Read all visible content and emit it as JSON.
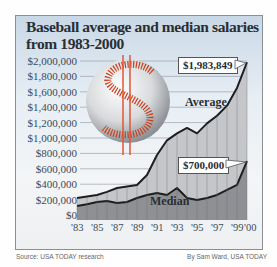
{
  "chart_data": {
    "type": "area",
    "title": "Baseball average and median salaries from 1983-2000",
    "xlabel": "",
    "ylabel": "",
    "ylim": [
      0,
      2000000
    ],
    "grid": true,
    "x": [
      1983,
      1984,
      1985,
      1986,
      1987,
      1988,
      1989,
      1990,
      1991,
      1992,
      1993,
      1994,
      1995,
      1996,
      1997,
      1998,
      1999,
      2000
    ],
    "x_tick_labels": [
      "'83",
      "'85",
      "'87",
      "'89",
      "'91",
      "'93",
      "'95",
      "'97",
      "'99",
      "'00"
    ],
    "y_tick_labels": [
      "$2,000,000",
      "$1,800,000",
      "$1,600,000",
      "$1,400,000",
      "$1,200,000",
      "$1,000,000",
      "$800,000",
      "$600,000",
      "$400,000",
      "$200,000",
      "$0"
    ],
    "series": [
      {
        "name": "Average",
        "values": [
          221000,
          240000,
          260000,
          300000,
          350000,
          370000,
          390000,
          520000,
          780000,
          970000,
          1060000,
          1130000,
          1060000,
          1190000,
          1290000,
          1420000,
          1650000,
          1983849
        ]
      },
      {
        "name": "Median",
        "values": [
          117000,
          140000,
          169000,
          182000,
          156000,
          169000,
          221000,
          260000,
          286000,
          260000,
          350000,
          221000,
          195000,
          221000,
          260000,
          325000,
          390000,
          700000
        ]
      }
    ],
    "annotations": [
      {
        "text": "$1,983,849",
        "x": 2000,
        "series": "Average"
      },
      {
        "text": "$700,000",
        "x": 2000,
        "series": "Median"
      }
    ]
  },
  "title": "Baseball average and median salaries from 1983-2000",
  "labels": {
    "average": "Average",
    "median": "Median",
    "avg_callout": "$1,983,849",
    "med_callout": "$700,000"
  },
  "footer": {
    "source": "Source: USA TODAY research",
    "credit": "By Sam Ward, USA TODAY"
  },
  "colors": {
    "average_fill": "#c4c6c9",
    "median_fill": "#8e9094",
    "line": "#1e1e1e",
    "accent": "#d9502c"
  }
}
